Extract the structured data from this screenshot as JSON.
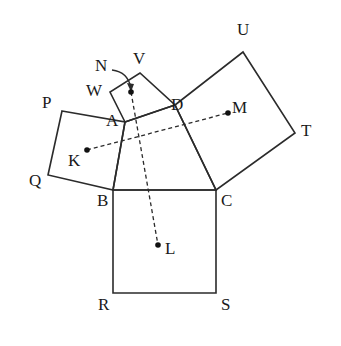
{
  "figure": {
    "stroke_color": "#2b2b2b",
    "dot_color": "#111111",
    "background": "#ffffff",
    "dash_pattern": "4 3"
  },
  "points": {
    "A": {
      "label": "A",
      "x": 125,
      "y": 122,
      "label_x": 106,
      "label_y": 112
    },
    "B": {
      "label": "B",
      "x": 113,
      "y": 190,
      "label_x": 97,
      "label_y": 192
    },
    "C": {
      "label": "C",
      "x": 216,
      "y": 190,
      "label_x": 221,
      "label_y": 192
    },
    "D": {
      "label": "D",
      "x": 175,
      "y": 105,
      "label_x": 171,
      "label_y": 96
    },
    "P": {
      "label": "P",
      "x": 62,
      "y": 111,
      "label_x": 42,
      "label_y": 94
    },
    "Q": {
      "label": "Q",
      "x": 48,
      "y": 175,
      "label_x": 29,
      "label_y": 172
    },
    "R": {
      "label": "R",
      "x": 113,
      "y": 293,
      "label_x": 98,
      "label_y": 296
    },
    "S": {
      "label": "S",
      "x": 216,
      "y": 293,
      "label_x": 221,
      "label_y": 296
    },
    "T": {
      "label": "T",
      "x": 295,
      "y": 133,
      "label_x": 301,
      "label_y": 122
    },
    "U": {
      "label": "U",
      "x": 243,
      "y": 52,
      "label_x": 237,
      "label_y": 21
    },
    "V": {
      "label": "V",
      "x": 140,
      "y": 73,
      "label_x": 133,
      "label_y": 50
    },
    "W": {
      "label": "W",
      "x": 110,
      "y": 92,
      "label_x": 86,
      "label_y": 82
    }
  },
  "centers": {
    "K": {
      "label": "K",
      "x": 87,
      "y": 150,
      "label_x": 68,
      "label_y": 152
    },
    "L": {
      "label": "L",
      "x": 158,
      "y": 245,
      "label_x": 165,
      "label_y": 240
    },
    "M": {
      "label": "M",
      "x": 228,
      "y": 113,
      "label_x": 232,
      "label_y": 99
    },
    "N": {
      "label": "N",
      "x": 131,
      "y": 92,
      "label_x": 95,
      "label_y": 57
    }
  },
  "squares": [
    {
      "name": "square-PQBA",
      "vertices": "62,111 125,122 113,190 48,175"
    },
    {
      "name": "square-BCSR",
      "vertices": "113,190 216,190 216,293 113,293"
    },
    {
      "name": "square-DUTC",
      "vertices": "175,105 243,52 295,133 216,190"
    },
    {
      "name": "square-AWVD",
      "vertices": "125,122 110,92 140,73 175,105"
    }
  ],
  "triangle": {
    "name": "triangle-ABC",
    "vertices": "125,122 113,190 216,190"
  },
  "dashed_segments": [
    {
      "name": "segment-KM",
      "x1": 87,
      "y1": 150,
      "x2": 228,
      "y2": 113
    },
    {
      "name": "segment-NL",
      "x1": 131,
      "y1": 92,
      "x2": 158,
      "y2": 245
    }
  ],
  "leader": {
    "name": "leader-N",
    "path": "M 112,70 Q 128,72 131,88"
  }
}
